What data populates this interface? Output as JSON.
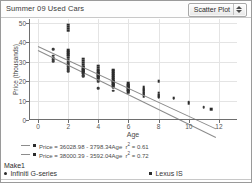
{
  "header": {
    "title": "Summer 09 Used Cars",
    "plot_type": "Scatter Plot"
  },
  "legend": {
    "group_title": "Make1",
    "fits": [
      {
        "equation": "Price = 36028.98 - 3798.34Age",
        "r2_label": "r",
        "r2_exp": "2",
        "r2_value": "= 0.61"
      },
      {
        "equation": "Price = 38000.39 - 3592.04Age",
        "r2_label": "r",
        "r2_exp": "2",
        "r2_value": "= 0.72"
      }
    ],
    "keys": [
      {
        "label": "Infiniti G-series",
        "marker": "circle"
      },
      {
        "label": "Lexus IS",
        "marker": "square"
      }
    ]
  },
  "chart_data": {
    "type": "scatter",
    "title": "Summer 09 Used Cars",
    "xlabel": "Age",
    "ylabel": "Price (thousands)",
    "xlim": [
      -0.6,
      13.2
    ],
    "ylim": [
      0,
      52
    ],
    "xticks": [
      0,
      2,
      4,
      6,
      8,
      10,
      12
    ],
    "yticks": [
      0,
      10,
      20,
      30,
      40,
      50
    ],
    "grid": true,
    "legend_position": "below",
    "series": [
      {
        "name": "Infiniti G-series",
        "marker": "circle",
        "fit": {
          "intercept": 36028.98,
          "slope": -3798.34,
          "r2": 0.61
        },
        "points": [
          [
            1,
            36.5
          ],
          [
            1,
            33.0
          ],
          [
            1,
            32.0
          ],
          [
            1,
            31.2
          ],
          [
            1,
            30.4
          ],
          [
            2,
            31.0
          ],
          [
            2,
            30.0
          ],
          [
            2,
            29.2
          ],
          [
            2,
            28.4
          ],
          [
            2,
            27.6
          ],
          [
            2,
            26.8
          ],
          [
            2,
            26.0
          ],
          [
            2,
            25.2
          ],
          [
            3,
            27.5
          ],
          [
            3,
            26.5
          ],
          [
            3,
            25.6
          ],
          [
            3,
            24.8
          ],
          [
            3,
            24.0
          ],
          [
            3,
            23.2
          ],
          [
            3,
            22.4
          ],
          [
            4,
            24.0
          ],
          [
            4,
            23.0
          ],
          [
            4,
            22.2
          ],
          [
            4,
            21.4
          ],
          [
            4,
            20.6
          ],
          [
            4,
            19.8
          ],
          [
            4,
            16.5
          ],
          [
            5,
            20.0
          ],
          [
            5,
            19.2
          ],
          [
            5,
            18.4
          ],
          [
            5,
            17.6
          ],
          [
            5,
            16.8
          ],
          [
            5,
            15.0
          ],
          [
            6,
            18.0
          ],
          [
            6,
            17.0
          ],
          [
            6,
            16.2
          ],
          [
            6,
            15.4
          ],
          [
            6,
            14.6
          ],
          [
            7,
            15.5
          ],
          [
            7,
            14.5
          ],
          [
            7,
            13.8
          ],
          [
            7,
            13.0
          ],
          [
            8,
            13.0
          ],
          [
            8,
            12.2
          ],
          [
            8,
            11.4
          ],
          [
            9,
            11.0
          ],
          [
            10,
            9.5
          ],
          [
            11,
            6.5
          ]
        ]
      },
      {
        "name": "Lexus IS",
        "marker": "square",
        "fit": {
          "intercept": 38000.39,
          "slope": -3592.04,
          "r2": 0.72
        },
        "points": [
          [
            2,
            49.0
          ],
          [
            2,
            48.0
          ],
          [
            2,
            47.0
          ],
          [
            2,
            46.0
          ],
          [
            2,
            36.0
          ],
          [
            2,
            35.0
          ],
          [
            2,
            34.0
          ],
          [
            2,
            33.0
          ],
          [
            2,
            32.0
          ],
          [
            3,
            31.5
          ],
          [
            3,
            30.5
          ],
          [
            3,
            29.5
          ],
          [
            3,
            28.5
          ],
          [
            3,
            27.5
          ],
          [
            3,
            26.5
          ],
          [
            3,
            25.5
          ],
          [
            3,
            24.5
          ],
          [
            4,
            28.0
          ],
          [
            4,
            27.0
          ],
          [
            4,
            26.0
          ],
          [
            4,
            25.0
          ],
          [
            4,
            24.0
          ],
          [
            4,
            23.0
          ],
          [
            4,
            22.0
          ],
          [
            5,
            26.0
          ],
          [
            5,
            25.0
          ],
          [
            5,
            24.0
          ],
          [
            5,
            23.0
          ],
          [
            5,
            22.0
          ],
          [
            5,
            21.0
          ],
          [
            5,
            20.0
          ],
          [
            5,
            19.0
          ],
          [
            5,
            18.0
          ],
          [
            6,
            19.0
          ],
          [
            6,
            18.0
          ],
          [
            6,
            17.0
          ],
          [
            6,
            16.0
          ],
          [
            6,
            15.0
          ],
          [
            6,
            14.0
          ],
          [
            7,
            17.0
          ],
          [
            7,
            16.0
          ],
          [
            7,
            15.0
          ],
          [
            7,
            14.0
          ],
          [
            7,
            13.0
          ],
          [
            7,
            12.0
          ],
          [
            8,
            20.0
          ],
          [
            8,
            14.0
          ],
          [
            8,
            13.0
          ],
          [
            8,
            12.0
          ],
          [
            9,
            11.5
          ],
          [
            10,
            8.5
          ],
          [
            11.5,
            5.5
          ]
        ]
      }
    ]
  }
}
